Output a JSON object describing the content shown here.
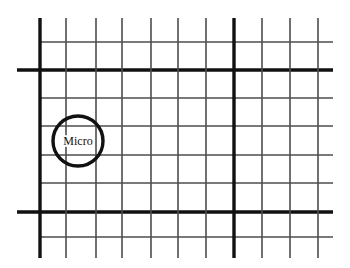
{
  "figure": {
    "name": "reinforcement-mesh-diagram",
    "background_color": "#ffffff",
    "width": 350,
    "height": 268,
    "line_color_thin": "#4d4d4d",
    "line_color_thick": "#111111",
    "thin_width": 1.6,
    "thick_width": 3.4,
    "annotation": {
      "label": "Micro",
      "circle": {
        "cx": 78,
        "cy": 141,
        "r": 25,
        "stroke_width": 3.4,
        "stroke_color": "#111111",
        "fill": "none"
      },
      "text_color": "#111111",
      "text_size": 12
    },
    "grid": {
      "vertical_lines": [
        {
          "x": 40,
          "y1": 18,
          "y2": 258,
          "weight": "thick"
        },
        {
          "x": 66,
          "y1": 18,
          "y2": 258,
          "weight": "thin"
        },
        {
          "x": 96,
          "y1": 18,
          "y2": 258,
          "weight": "thin"
        },
        {
          "x": 122,
          "y1": 18,
          "y2": 258,
          "weight": "thin"
        },
        {
          "x": 151,
          "y1": 18,
          "y2": 258,
          "weight": "thin"
        },
        {
          "x": 178,
          "y1": 18,
          "y2": 258,
          "weight": "thin"
        },
        {
          "x": 206,
          "y1": 18,
          "y2": 258,
          "weight": "thin"
        },
        {
          "x": 234,
          "y1": 18,
          "y2": 258,
          "weight": "thick"
        },
        {
          "x": 262,
          "y1": 18,
          "y2": 258,
          "weight": "thin"
        },
        {
          "x": 290,
          "y1": 18,
          "y2": 258,
          "weight": "thin"
        },
        {
          "x": 318,
          "y1": 18,
          "y2": 258,
          "weight": "thin"
        }
      ],
      "horizontal_lines": [
        {
          "y": 42,
          "x1": 40,
          "x2": 333,
          "weight": "thin"
        },
        {
          "y": 70,
          "x1": 17,
          "x2": 333,
          "weight": "thick"
        },
        {
          "y": 98,
          "x1": 40,
          "x2": 333,
          "weight": "thin"
        },
        {
          "y": 126,
          "x1": 40,
          "x2": 333,
          "weight": "thin"
        },
        {
          "y": 155,
          "x1": 40,
          "x2": 333,
          "weight": "thin"
        },
        {
          "y": 183,
          "x1": 40,
          "x2": 333,
          "weight": "thin"
        },
        {
          "y": 212,
          "x1": 17,
          "x2": 333,
          "weight": "thick"
        },
        {
          "y": 237,
          "x1": 40,
          "x2": 333,
          "weight": "thin"
        }
      ]
    }
  }
}
